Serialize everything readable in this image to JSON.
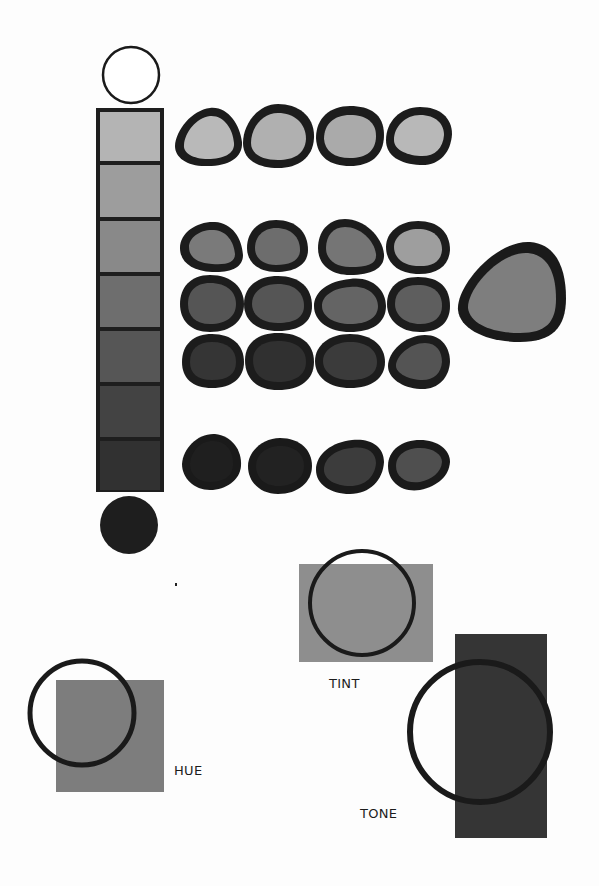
{
  "labels": {
    "hue": "HUE",
    "tint": "TINT",
    "tone": "TONE"
  },
  "colors": {
    "background": "#fdfdfd",
    "outline": "#1a1a1a",
    "value_scale": [
      "#ffffff",
      "#b4b4b4",
      "#9d9d9d",
      "#898989",
      "#6e6e6e",
      "#565656",
      "#434343",
      "#313131",
      "#262626",
      "#1e1e1e"
    ],
    "hue_fill": "#7d7d7d",
    "tint_fill": "#8e8e8e",
    "tone_fill": "#353535",
    "large_blob_fill": "#7e7e7e"
  },
  "value_scale": {
    "top_circle": "white",
    "swatches": 7,
    "bottom_circle": "black"
  },
  "blob_rows": [
    {
      "row": "light",
      "fills": [
        "#b9b9b9",
        "#b0b0b0",
        "#aaaaaa",
        "#b8b8b8"
      ]
    },
    {
      "row": "mid-light",
      "fills": [
        "#7a7a7a",
        "#6d6d6d",
        "#757575",
        "#9e9e9e"
      ]
    },
    {
      "row": "mid",
      "fills": [
        "#555555",
        "#555555",
        "#646464",
        "#5e5e5e"
      ]
    },
    {
      "row": "mid-dark",
      "fills": [
        "#353535",
        "#303030",
        "#3b3b3b",
        "#545454"
      ]
    },
    {
      "row": "dark",
      "fills": [
        "#1f1f1f",
        "#222222",
        "#3c3c3c",
        "#4f4f4f"
      ]
    }
  ],
  "diagrams": [
    {
      "name": "hue",
      "label": "HUE"
    },
    {
      "name": "tint",
      "label": "TINT"
    },
    {
      "name": "tone",
      "label": "TONE"
    }
  ]
}
